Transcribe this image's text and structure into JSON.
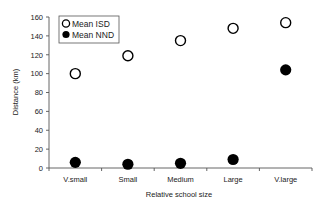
{
  "chart_data": {
    "type": "scatter",
    "title": "",
    "xlabel": "Relative school size",
    "ylabel": "Distance (km)",
    "categories": [
      "V.small",
      "Small",
      "Medium",
      "Large",
      "V.large"
    ],
    "ylim": [
      0,
      160
    ],
    "yticks": [
      0,
      20,
      40,
      60,
      80,
      100,
      120,
      140,
      160
    ],
    "grid": false,
    "legend_position": "upper-left",
    "series": [
      {
        "name": "Mean ISD",
        "marker": "open-circle",
        "color": "#000000",
        "values": [
          100,
          119,
          135,
          148,
          154
        ]
      },
      {
        "name": "Mean NND",
        "marker": "filled-circle",
        "color": "#000000",
        "values": [
          6,
          4,
          5,
          9,
          104
        ]
      }
    ]
  },
  "legend": {
    "items": [
      "Mean ISD",
      "Mean NND"
    ]
  }
}
